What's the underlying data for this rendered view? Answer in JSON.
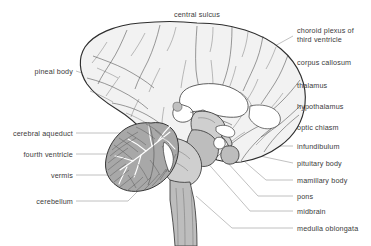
{
  "figure": {
    "background_color": "#ffffff",
    "label_color": "#3b3b3b",
    "leader_color": "#8d8d8d",
    "outline_color": "#2e2e2e"
  },
  "labels": {
    "central_sulcus": "central sulcus",
    "choroid_plexus_1": "choroid plexus of",
    "choroid_plexus_2": "third ventricle",
    "corpus_callosum": "corpus callosum",
    "thalamus": "thalamus",
    "hypothalamus": "hypothalamus",
    "optic_chiasm": "optic chiasm",
    "infundibulum": "infundibulum",
    "pituitary_body": "pituitary body",
    "mamillary_body": "mamillary body",
    "pons": "pons",
    "midbrain": "midbrain",
    "medulla_oblongata": "medulla oblongata",
    "pineal_body": "pineal body",
    "cerebral_aqueduct": "cerebral aqueduct",
    "fourth_ventricle": "fourth ventricle",
    "vermis": "vermis",
    "cerebellum": "cerebellum"
  }
}
